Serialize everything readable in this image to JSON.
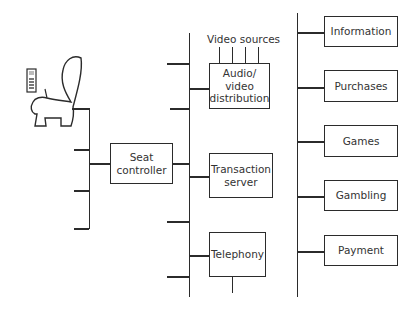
{
  "diagram": {
    "seat": {
      "icon": "seat-icon",
      "handset_icon": "handset-icon"
    },
    "seat_controller": {
      "line1": "Seat",
      "line2": "controller"
    },
    "video_sources_label": "Video sources",
    "av_distribution": {
      "line1": "Audio/",
      "line2": "video",
      "line3": "distribution"
    },
    "transaction_server": {
      "line1": "Transaction",
      "line2": "server"
    },
    "telephony": {
      "label": "Telephony"
    },
    "services": [
      {
        "label": "Information"
      },
      {
        "label": "Purchases"
      },
      {
        "label": "Games"
      },
      {
        "label": "Gambling"
      },
      {
        "label": "Payment"
      }
    ],
    "colors": {
      "stroke": "#2b2b2b",
      "background": "#ffffff"
    }
  }
}
